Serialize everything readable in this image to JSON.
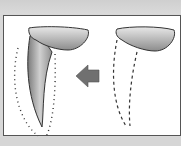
{
  "illustration": {
    "description": "Tooth root transformation diagram",
    "left_figure": "tooth-with-root-and-dotted-outline",
    "arrow": "left-arrow",
    "right_figure": "tooth-crown-with-dashed-root-outline"
  },
  "colors": {
    "background": "#d8d8d8",
    "panel": "#ffffff",
    "outline": "#333333",
    "arrow": "#707070",
    "fill_dark": "#8a8a8a",
    "fill_light": "#e6e6e6"
  }
}
